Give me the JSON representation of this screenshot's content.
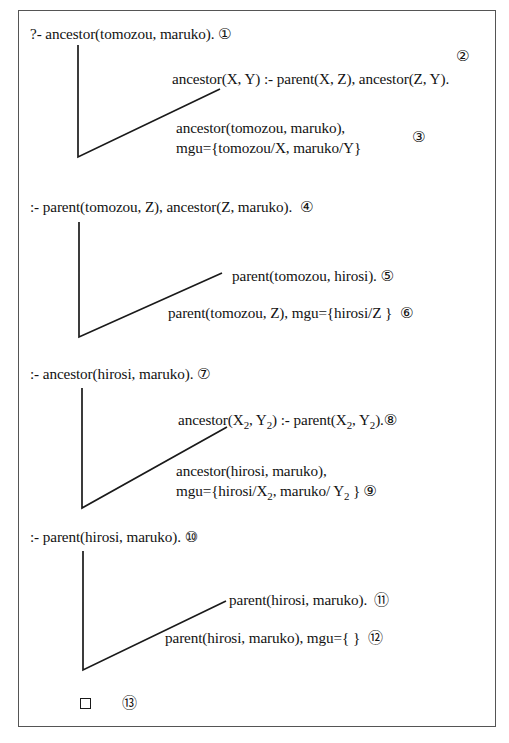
{
  "diagram": {
    "type": "prolog-sld-derivation-tree",
    "border_color": "#555555",
    "line_color": "#1a1a1a",
    "text_color": "#121212"
  },
  "steps": [
    {
      "id": 1,
      "marker": "①",
      "text": "?- ancestor(tomozou, maruko).",
      "role": "initial-goal"
    },
    {
      "id": 2,
      "marker": "②",
      "text": "ancestor(X, Y) :- parent(X, Z), ancestor(Z, Y).",
      "role": "program-clause"
    },
    {
      "id": 3,
      "marker": "③",
      "line1": "ancestor(tomozou, maruko),",
      "line2": "mgu={tomozou/X, maruko/Y}",
      "role": "unification"
    },
    {
      "id": 4,
      "marker": "④",
      "text": ":- parent(tomozou, Z), ancestor(Z, maruko).",
      "role": "resolvent-goal"
    },
    {
      "id": 5,
      "marker": "⑤",
      "text": "parent(tomozou, hirosi).",
      "role": "program-clause"
    },
    {
      "id": 6,
      "marker": "⑥",
      "text": "parent(tomozou, Z), mgu={hirosi/Z }",
      "role": "unification"
    },
    {
      "id": 7,
      "marker": "⑦",
      "text": ":- ancestor(hirosi, maruko).",
      "role": "resolvent-goal"
    },
    {
      "id": 8,
      "marker": "⑧",
      "text_pre": "ancestor(X",
      "sub_a": "2",
      "text_mid": ", Y",
      "sub_b": "2",
      "text_mid2": ") :- parent(X",
      "sub_c": "2",
      "text_mid3": ", Y",
      "sub_d": "2",
      "text_post": ").",
      "plain": "ancestor(X2, Y2) :- parent(X2, Y2).",
      "role": "program-clause"
    },
    {
      "id": 9,
      "marker": "⑨",
      "line1": "ancestor(hirosi, maruko),",
      "line2_pre": "mgu={hirosi/X",
      "sub_a": "2",
      "line2_mid": ", maruko/ Y",
      "sub_b": "2",
      "line2_post": " }",
      "line2_plain": "mgu={hirosi/X2, maruko/ Y2 }",
      "role": "unification"
    },
    {
      "id": 10,
      "marker": "⑩",
      "text": ":- parent(hirosi, maruko).",
      "role": "resolvent-goal"
    },
    {
      "id": 11,
      "marker": "⑪",
      "text": "parent(hirosi, maruko).",
      "role": "program-clause"
    },
    {
      "id": 12,
      "marker": "⑫",
      "text": "parent(hirosi, maruko), mgu={ }",
      "role": "unification"
    },
    {
      "id": 13,
      "marker": "⑬",
      "text": "□",
      "role": "empty-clause-success"
    }
  ]
}
